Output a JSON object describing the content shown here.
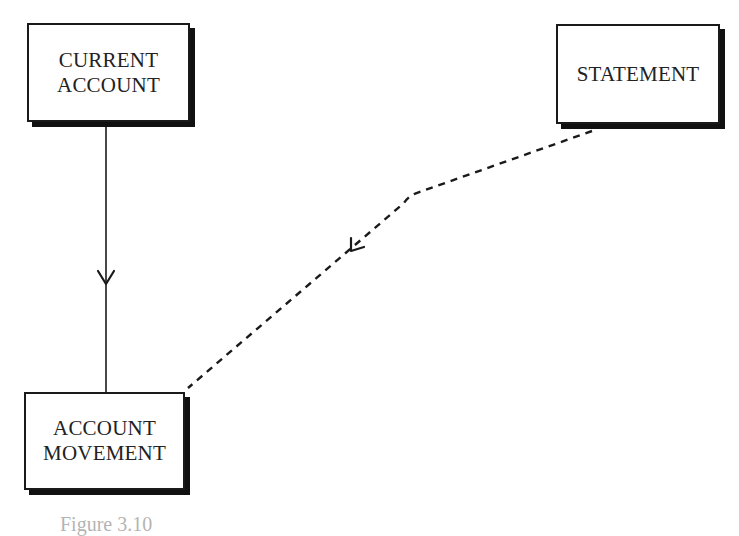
{
  "diagram": {
    "type": "entity-relationship",
    "entities": [
      {
        "id": "current-account",
        "label": "CURRENT\nACCOUNT"
      },
      {
        "id": "statement",
        "label": "STATEMENT"
      },
      {
        "id": "account-movement",
        "label": "ACCOUNT\nMOVEMENT"
      }
    ],
    "relationships": [
      {
        "from": "current-account",
        "to": "account-movement",
        "line_style": "solid",
        "arrow": "open-chevron-down"
      },
      {
        "from": "statement",
        "to": "account-movement",
        "line_style": "dashed",
        "arrow": "open-chevron-down-left"
      }
    ],
    "caption": "Figure 3.10"
  },
  "colors": {
    "line": "#1a1a1a",
    "shadow": "#111111",
    "background": "#ffffff"
  }
}
